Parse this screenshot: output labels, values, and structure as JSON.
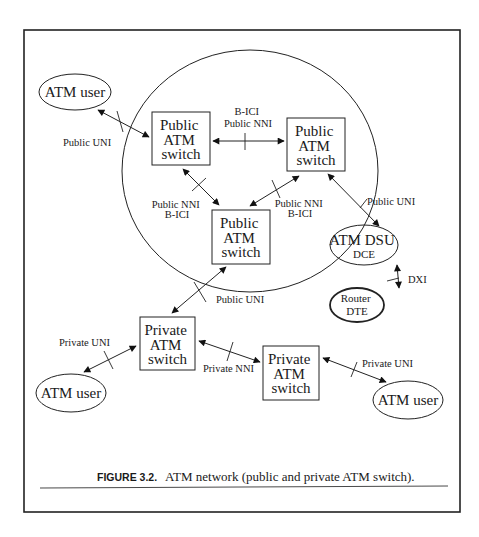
{
  "figure": {
    "caption_label": "FIGURE 3.2.",
    "caption_text": "ATM network (public and private ATM switch)."
  },
  "nodes": {
    "atm_user_top": "ATM user",
    "public_switch_1": [
      "Public",
      "ATM",
      "switch"
    ],
    "public_switch_2": [
      "Public",
      "ATM",
      "switch"
    ],
    "public_switch_3": [
      "Public",
      "ATM",
      "switch"
    ],
    "atm_dsu": [
      "ATM DSU",
      "DCE"
    ],
    "router": [
      "Router",
      "DTE"
    ],
    "private_switch_1": [
      "Private",
      "ATM",
      "switch"
    ],
    "private_switch_2": [
      "Private",
      "ATM",
      "switch"
    ],
    "atm_user_bottom_left": "ATM user",
    "atm_user_bottom_right": "ATM user"
  },
  "edges": {
    "user_top_to_pub1": "Public UNI",
    "pub1_to_pub2": [
      "B-ICI",
      "Public NNI"
    ],
    "pub1_to_pub3": [
      "Public NNI",
      "B-ICI"
    ],
    "pub3_to_pub2": [
      "Public NNI",
      "B-ICI"
    ],
    "pub2_to_dsu": "Public UNI",
    "dsu_to_router": "DXI",
    "pub3_to_priv1": "Public UNI",
    "priv1_to_user": "Private UNI",
    "priv1_to_priv2": "Private NNI",
    "priv2_to_user": "Private UNI"
  }
}
